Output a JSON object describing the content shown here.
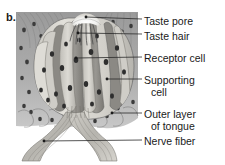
{
  "figure": {
    "letter": "b.",
    "background_color": "#ffffff",
    "text_color": "#1a1a1a"
  },
  "labels": [
    {
      "id": "taste-pore",
      "text": "Taste pore",
      "line2": ""
    },
    {
      "id": "taste-hair",
      "text": "Taste hair",
      "line2": ""
    },
    {
      "id": "receptor-cell",
      "text": "Receptor cell",
      "line2": ""
    },
    {
      "id": "supporting-cell",
      "text": "Supporting",
      "line2": "cell"
    },
    {
      "id": "outer-layer-of-tongue",
      "text": "Outer layer",
      "line2": "of tongue"
    },
    {
      "id": "nerve-fiber",
      "text": "Nerve fiber",
      "line2": ""
    }
  ],
  "illustration": {
    "description": "Grayscale cross-section drawing of a taste bud embedded in tongue epithelium, with nerve fibers branching from its base",
    "palette": {
      "epithelium_dark": "#8a8a8a",
      "epithelium_mid": "#a5a5a5",
      "epithelium_light": "#c4c4c4",
      "taste_bud_light": "#d8d6d0",
      "receptor_cell": "#8f8d88",
      "supporting_cell": "#b8b6b0",
      "nucleus": "#3a3a3a",
      "nerve_fiber": "#b0aea8",
      "outline": "#5d5d5d",
      "pore_highlight": "#fdfdfd"
    }
  }
}
